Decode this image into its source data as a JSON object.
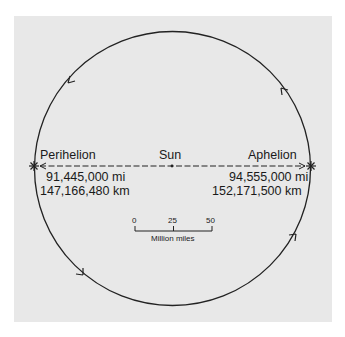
{
  "diagram": {
    "colors": {
      "background": "#e8e8e8",
      "stroke": "#222222",
      "page": "#ffffff"
    },
    "labels": {
      "perihelion": "Perihelion",
      "sun": "Sun",
      "aphelion": "Aphelion"
    },
    "perihelion_distance": {
      "miles": "91,445,000 mi",
      "km": "147,166,480 km"
    },
    "aphelion_distance": {
      "miles": "94,555,000 mi",
      "km": "152,171,500 km"
    },
    "scale_bar": {
      "ticks": [
        "0",
        "25",
        "50"
      ],
      "unit": "Million miles"
    },
    "markers": {
      "perihelion_marker": "*",
      "aphelion_marker": "*"
    },
    "orbit_direction": "counterclockwise"
  }
}
